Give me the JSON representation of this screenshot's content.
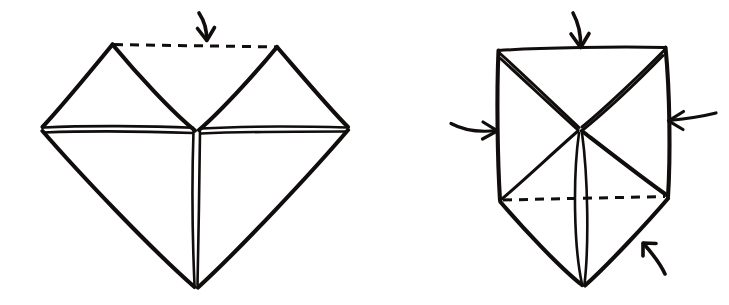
{
  "figure": {
    "title": "Origami folding diagram: two steps",
    "background_color": "#ffffff",
    "ink_color": "#100d0c",
    "style": "hand-drawn pen sketch",
    "width": 729,
    "height": 305
  },
  "panels": [
    {
      "id": "left-panel",
      "name": "Step 1 — diamond / waterbomb base partially opened",
      "shape_description": "Downward-pointing kite formed by two upper triangular flaps meeting a large lower diamond",
      "vertices": {
        "left": [
          42,
          127
        ],
        "right": [
          348,
          127
        ],
        "bottom": [
          196,
          288
        ],
        "top_left_peak": [
          112,
          44
        ],
        "top_right_peak": [
          277,
          47
        ],
        "center": [
          196,
          130
        ]
      },
      "creases": [
        "horizontal doubled crease from left vertex to right vertex",
        "vertical doubled crease from center down to bottom point",
        "diagonal from top-left peak down to center",
        "diagonal from top-right peak down to center"
      ],
      "dashed_lines": [
        {
          "name": "valley-fold-top",
          "from": [
            112,
            44
          ],
          "to": [
            277,
            47
          ]
        }
      ],
      "arrows": [
        {
          "name": "fold-down-arrow",
          "direction": "down",
          "label": "",
          "tip": [
            206,
            40
          ],
          "curved": true
        }
      ]
    },
    {
      "id": "right-panel",
      "name": "Step 2 — collapse inward on all sides",
      "shape_description": "Square upper body with an X of creases meeting at center and a downward point below",
      "vertices": {
        "top_left": [
          498,
          50
        ],
        "top_right": [
          665,
          47
        ],
        "mid_left": [
          500,
          200
        ],
        "mid_right": [
          668,
          196
        ],
        "bottom": [
          583,
          285
        ],
        "center": [
          580,
          128
        ]
      },
      "creases": [
        "doubled diagonal from top-left corner to center",
        "doubled diagonal from top-right corner to center",
        "diagonal from center down-left to mid-left vertex",
        "diagonal from center down-right to mid-right vertex",
        "vertical doubled crease from center to bottom point"
      ],
      "dashed_lines": [
        {
          "name": "valley-fold-waist",
          "from": [
            500,
            200
          ],
          "to": [
            668,
            196
          ]
        }
      ],
      "arrows": [
        {
          "name": "push-down-arrow",
          "direction": "down",
          "tip": [
            580,
            47
          ],
          "curved": true
        },
        {
          "name": "push-right-arrow",
          "direction": "right",
          "tip": [
            497,
            130
          ],
          "curved": true
        },
        {
          "name": "push-left-arrow",
          "direction": "left",
          "tip": [
            669,
            120
          ],
          "curved": true
        },
        {
          "name": "push-up-left-arrow",
          "direction": "up-left",
          "tip": [
            643,
            243
          ],
          "curved": true
        }
      ]
    }
  ],
  "legend": {
    "solid_line": "existing fold / edge",
    "dashed_line": "valley fold line",
    "arrow": "fold direction"
  }
}
